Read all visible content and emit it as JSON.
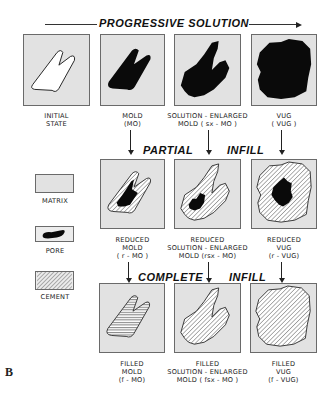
{
  "figure": {
    "letter": "B",
    "colors": {
      "matrix": "#e2e2e2",
      "pore": "#0a0a0a",
      "cement_lines": "#4a4a4a",
      "outline": "#222222",
      "panel_border": "#6a6a6a"
    }
  },
  "headings": {
    "progressive_solution": "PROGRESSIVE  SOLUTION",
    "partial": "PARTIAL",
    "partial_infill": "INFILL",
    "complete": "COMPLETE",
    "complete_infill": "INFILL"
  },
  "legend": {
    "items": [
      {
        "id": "matrix",
        "label": "MATRIX"
      },
      {
        "id": "pore",
        "label": "PORE"
      },
      {
        "id": "cement",
        "label": "CEMENT"
      }
    ]
  },
  "rows": {
    "solution": [
      {
        "id": "initial",
        "lines": [
          "INITIAL",
          "STATE"
        ]
      },
      {
        "id": "mold",
        "lines": [
          "MOLD",
          "(MO)"
        ]
      },
      {
        "id": "sx-mold",
        "lines": [
          "SOLUTION - ENLARGED",
          "MOLD  ( sx - MO )"
        ]
      },
      {
        "id": "vug",
        "lines": [
          "VUG",
          "( VUG )"
        ]
      }
    ],
    "partial_infill": [
      {
        "id": "r-mold",
        "lines": [
          "REDUCED",
          "MOLD",
          "( r - MO )"
        ]
      },
      {
        "id": "rsx-mold",
        "lines": [
          "REDUCED",
          "SOLUTION - ENLARGED",
          "MOLD  (rsx - MO)"
        ]
      },
      {
        "id": "r-vug",
        "lines": [
          "REDUCED",
          "VUG",
          "(r - VUG)"
        ]
      }
    ],
    "complete_infill": [
      {
        "id": "f-mold",
        "lines": [
          "FILLED",
          "MOLD",
          "(f - MO)"
        ]
      },
      {
        "id": "fsx-mold",
        "lines": [
          "FILLED",
          "SOLUTION - ENLARGED",
          "MOLD  ( fsx - MO )"
        ]
      },
      {
        "id": "f-vug",
        "lines": [
          "FILLED",
          "VUG",
          "(f - VUG)"
        ]
      }
    ]
  }
}
